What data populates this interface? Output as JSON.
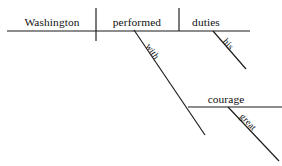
{
  "diagram": {
    "kind": "reed-kellogg-sentence-diagram",
    "sentence": "Washington performed his duties with great courage.",
    "canvas": {
      "width": 282,
      "height": 166,
      "background": "#ffffff"
    },
    "stroke_color": "#1a1a1a",
    "text_color": "#111111",
    "baseline": {
      "name": "main-baseline",
      "x1": 7,
      "y1": 31,
      "x2": 250,
      "y2": 31
    },
    "dividers": [
      {
        "name": "subject-verb-divider",
        "role": "subject/predicate separator (crosses baseline)",
        "x1": 96,
        "y1": 8,
        "x2": 96,
        "y2": 41
      },
      {
        "name": "verb-object-divider",
        "role": "verb/direct-object separator (stops at baseline)",
        "x1": 179,
        "y1": 8,
        "x2": 179,
        "y2": 31
      }
    ],
    "words": [
      {
        "id": "subject",
        "text": "Washington",
        "role": "subject",
        "orientation": "horizontal",
        "x": 52,
        "y": 26,
        "size": "main"
      },
      {
        "id": "verb",
        "text": "performed",
        "role": "verb",
        "orientation": "horizontal",
        "x": 137,
        "y": 26,
        "size": "main"
      },
      {
        "id": "object",
        "text": "duties",
        "role": "direct object",
        "orientation": "horizontal",
        "x": 206,
        "y": 26,
        "size": "main"
      },
      {
        "id": "preposition",
        "text": "with",
        "role": "preposition",
        "orientation": "diagonal",
        "x": 150,
        "y": 53,
        "rotate": 56,
        "size": "mod"
      },
      {
        "id": "prep-object",
        "text": "courage",
        "role": "object of preposition",
        "orientation": "horizontal",
        "x": 226,
        "y": 103,
        "size": "main"
      },
      {
        "id": "modifier-his",
        "text": "his",
        "role": "possessive adjective modifying 'duties'",
        "orientation": "diagonal",
        "x": 226,
        "y": 46,
        "rotate": 49,
        "size": "mod"
      },
      {
        "id": "modifier-great",
        "text": "great",
        "role": "adjective modifying 'courage'",
        "orientation": "diagonal",
        "x": 246,
        "y": 124,
        "rotate": 46,
        "size": "mod"
      }
    ],
    "connectors": [
      {
        "name": "preposition-slant-line",
        "for": "with",
        "x1": 134,
        "y1": 30,
        "x2": 205,
        "y2": 135
      },
      {
        "name": "prepositional-phrase-baseline",
        "for": "courage",
        "x1": 188,
        "y1": 107,
        "x2": 282,
        "y2": 107
      },
      {
        "name": "modifier-slant-line-his",
        "for": "his",
        "x1": 213,
        "y1": 31,
        "x2": 246,
        "y2": 69
      },
      {
        "name": "modifier-slant-line-great",
        "for": "great",
        "x1": 228,
        "y1": 107,
        "x2": 279,
        "y2": 161
      }
    ]
  }
}
